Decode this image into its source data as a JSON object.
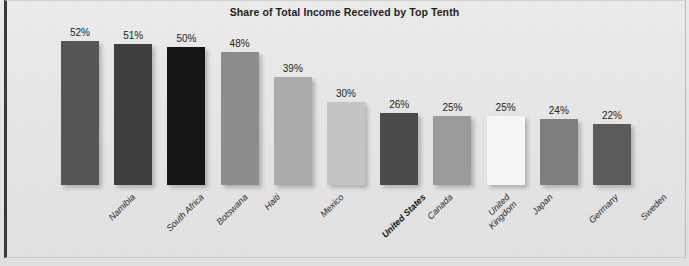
{
  "chart_data": {
    "type": "bar",
    "title": "Share of Total Income Received by Top Tenth",
    "xlabel": "",
    "ylabel": "",
    "ylim": [
      0,
      52
    ],
    "grid": false,
    "legend": "none",
    "value_suffix": "%",
    "categories": [
      "Namibia",
      "South Africa",
      "Botswana",
      "Haiti",
      "Mexico",
      "United States",
      "Canada",
      "United Kingdom",
      "Japan",
      "Germany",
      "Sweden"
    ],
    "values": [
      52,
      51,
      50,
      48,
      39,
      30,
      26,
      25,
      25,
      24,
      22
    ],
    "value_labels": [
      "52%",
      "51%",
      "50%",
      "48%",
      "39%",
      "30%",
      "26%",
      "25%",
      "25%",
      "24%",
      "22%"
    ],
    "bar_colors": [
      "#565656",
      "#3f3f3f",
      "#151515",
      "#8d8d8d",
      "#ababab",
      "#c5c5c5",
      "#4b4b4b",
      "#9b9b9b",
      "#f6f6f6",
      "#7e7e7e",
      "#5b5b5b"
    ],
    "highlight_category": "United States",
    "background_color": "#e9e9e9",
    "border_color": "#3a3a3a"
  }
}
